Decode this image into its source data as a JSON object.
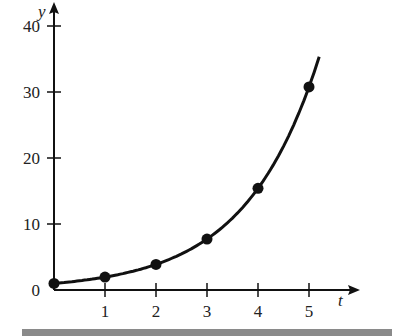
{
  "chart_data": {
    "type": "line",
    "title": "",
    "xlabel": "t",
    "ylabel": "y",
    "x": [
      0,
      1,
      2,
      3,
      4,
      5
    ],
    "series": [
      {
        "name": "y = 2^t",
        "values": [
          1,
          2,
          4,
          8,
          16,
          32
        ],
        "markers": true
      }
    ],
    "curve_extent": {
      "t_start": 0,
      "t_end": 5.2
    },
    "xticks": [
      "1",
      "2",
      "3",
      "4",
      "5"
    ],
    "yticks": [
      "0",
      "10",
      "20",
      "30",
      "40"
    ],
    "xlim": [
      0,
      5.6
    ],
    "ylim": [
      0,
      40
    ],
    "grid": false,
    "legend": "none",
    "origin_label": "0"
  },
  "colors": {
    "line": "#111111",
    "axis": "#111111",
    "bottom_bar": "#8a8a8a"
  }
}
